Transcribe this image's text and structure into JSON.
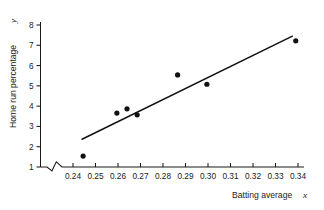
{
  "chart_data": {
    "type": "scatter",
    "title": "",
    "subtitle": "",
    "xlabel": "Batting average",
    "xlabel_variable": "x",
    "ylabel": "Home run percentage",
    "ylabel_variable": "y",
    "xlim": [
      0.2355,
      0.3445
    ],
    "ylim": [
      0.88,
      8.2
    ],
    "x_ticks": [
      0.24,
      0.25,
      0.26,
      0.27,
      0.28,
      0.29,
      0.3,
      0.31,
      0.32,
      0.33,
      0.34
    ],
    "x_tick_labels": [
      "0.24",
      "0.25",
      "0.26",
      "0.27",
      "0.28",
      "0.29",
      "0.30",
      "0.31",
      "0.32",
      "0.33",
      "0.34"
    ],
    "y_ticks": [
      1,
      2,
      3,
      4,
      5,
      6,
      7,
      8
    ],
    "y_tick_labels": [
      "1",
      "2",
      "3",
      "4",
      "5",
      "6",
      "7",
      "8"
    ],
    "grid": false,
    "legend": false,
    "axis_break": {
      "axis": "x",
      "position_between": [
        0.2355,
        0.24
      ],
      "style": "zigzag"
    },
    "points": [
      {
        "x": 0.2445,
        "y": 1.54
      },
      {
        "x": 0.2595,
        "y": 3.66
      },
      {
        "x": 0.264,
        "y": 3.87
      },
      {
        "x": 0.2685,
        "y": 3.57
      },
      {
        "x": 0.2865,
        "y": 5.54
      },
      {
        "x": 0.2995,
        "y": 5.08
      },
      {
        "x": 0.339,
        "y": 7.22
      }
    ],
    "series": [
      {
        "name": "observations",
        "x": [
          0.2445,
          0.2595,
          0.264,
          0.2685,
          0.2865,
          0.2995,
          0.339
        ],
        "values": [
          1.54,
          3.66,
          3.87,
          3.57,
          5.54,
          5.08,
          7.22
        ]
      }
    ],
    "fit_line": {
      "name": "least-squares regression line",
      "x0": 0.244,
      "y0": 2.37,
      "x1": 0.3375,
      "y1": 7.45
    },
    "colors": {
      "point": "#111111",
      "line": "#111111",
      "axis": "#1a1a1a",
      "background": "#ffffff"
    }
  }
}
